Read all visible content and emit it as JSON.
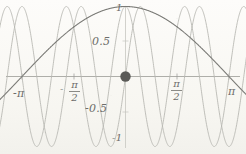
{
  "figure": {
    "name": "trig-superposition-plot",
    "background": "#fbfaf7",
    "ink_dark": "#7a7a76",
    "ink_light": "#b9b9b3",
    "axis_color": "#9a9a95",
    "dot_color": "#5a5a57"
  },
  "labels": {
    "x_left": "-π",
    "x_right": "π",
    "x_neg_half_sign": "-",
    "x_neg_half_num": "π",
    "x_neg_half_den": "2",
    "x_pos_half_num": "π",
    "x_pos_half_den": "2",
    "y_one": "1",
    "y_half": "0.5",
    "y_neg_half": "-0.5",
    "y_neg_one": "-1"
  },
  "chart_data": {
    "type": "line",
    "title": "",
    "xlabel": "",
    "ylabel": "",
    "xlim": [
      -3.14159265,
      3.14159265
    ],
    "ylim": [
      -1.08,
      1.08
    ],
    "grid": false,
    "legend": "none",
    "xticks": [
      -3.14159265,
      -1.57079633,
      1.57079633,
      3.14159265
    ],
    "xticklabels": [
      "-π",
      "-π/2",
      "π/2",
      "π"
    ],
    "yticks": [
      -1,
      -0.5,
      0.5,
      1
    ],
    "yticklabels": [
      "-1",
      "-0.5",
      "0.5",
      "1"
    ],
    "annotations": [
      {
        "type": "point",
        "x": 0,
        "y": 0,
        "label": "",
        "marker": "filled-circle",
        "size": 5
      }
    ],
    "series": [
      {
        "name": "slow-cosine",
        "expression": "cos(x)",
        "color": "#7a7a76",
        "width": 1.1,
        "x": [
          -3.14159265,
          -2.82743339,
          -2.51327412,
          -2.19911486,
          -1.88495559,
          -1.57079633,
          -1.25663706,
          -0.9424778,
          -0.62831853,
          -0.31415927,
          0,
          0.31415927,
          0.62831853,
          0.9424778,
          1.25663706,
          1.57079633,
          1.88495559,
          2.19911486,
          2.51327412,
          2.82743339,
          3.14159265
        ],
        "y": [
          -1,
          -0.95105652,
          -0.80901699,
          -0.58778525,
          -0.30901699,
          0,
          0.30901699,
          0.58778525,
          0.80901699,
          0.95105652,
          1,
          0.95105652,
          0.80901699,
          0.58778525,
          0.30901699,
          0,
          -0.30901699,
          -0.58778525,
          -0.80901699,
          -0.95105652,
          -1
        ]
      },
      {
        "name": "fast-cosine",
        "expression": "cos(7x)",
        "color": "#b9b9b3",
        "width": 0.9,
        "period": 0.8975979,
        "cycles_in_view": 7,
        "peaks_x": [
          -2.6927937,
          -1.7951958,
          -0.8975979,
          0,
          0.8975979,
          1.7951958,
          2.6927937
        ],
        "peaks_y": [
          1,
          1,
          1,
          1,
          1,
          1,
          1
        ],
        "troughs_x": [
          -3.14159265,
          -2.24399475,
          -1.34639685,
          -0.44879895,
          0.44879895,
          1.34639685,
          2.24399475,
          3.14159265
        ],
        "troughs_y": [
          -1,
          -1,
          -1,
          -1,
          -1,
          -1,
          -1,
          -1
        ]
      },
      {
        "name": "fast-sine",
        "expression": "sin(7x)",
        "color": "#b9b9b3",
        "width": 0.9,
        "period": 0.8975979,
        "cycles_in_view": 7,
        "peaks_x": [
          -2.91699368,
          -2.01939578,
          -1.12179788,
          -0.22419998,
          0.67339792,
          1.57079633,
          2.46839423,
          3.14159265
        ],
        "peaks_y": [
          1,
          1,
          1,
          1,
          1,
          1,
          1,
          0.5
        ]
      }
    ]
  }
}
